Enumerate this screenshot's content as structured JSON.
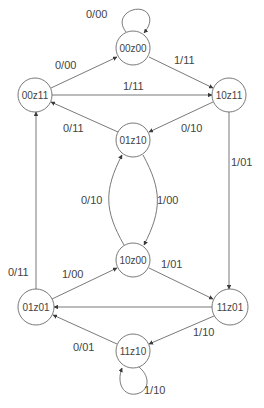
{
  "diagram": {
    "type": "state-transition-diagram",
    "states": [
      {
        "id": "s00z00",
        "label": "00z00",
        "cx": 133,
        "cy": 48,
        "r": 17
      },
      {
        "id": "s00z11",
        "label": "00z11",
        "cx": 35,
        "cy": 95,
        "r": 17
      },
      {
        "id": "s10z11",
        "label": "10z11",
        "cx": 229,
        "cy": 95,
        "r": 17
      },
      {
        "id": "s01z10",
        "label": "01z10",
        "cx": 133,
        "cy": 140,
        "r": 17
      },
      {
        "id": "s10z00",
        "label": "10z00",
        "cx": 133,
        "cy": 260,
        "r": 17
      },
      {
        "id": "s01z01",
        "label": "01z01",
        "cx": 36,
        "cy": 307,
        "r": 18
      },
      {
        "id": "s11z01",
        "label": "11z01",
        "cx": 230,
        "cy": 307,
        "r": 18
      },
      {
        "id": "s11z10",
        "label": "11z10",
        "cx": 133,
        "cy": 351,
        "r": 17
      }
    ],
    "transitions": [
      {
        "from": "00z00",
        "to": "00z00",
        "label": "0/00",
        "label_x": 86,
        "label_y": 18
      },
      {
        "from": "00z11",
        "to": "00z00",
        "label": "0/00",
        "label_x": 55,
        "label_y": 69
      },
      {
        "from": "00z00",
        "to": "10z11",
        "label": "1/11",
        "label_x": 174,
        "label_y": 64
      },
      {
        "from": "00z11",
        "to": "10z11",
        "label": "1/11",
        "label_x": 123,
        "label_y": 90
      },
      {
        "from": "01z10",
        "to": "00z11",
        "label": "0/11",
        "label_x": 63,
        "label_y": 132
      },
      {
        "from": "10z11",
        "to": "01z10",
        "label": "0/10",
        "label_x": 181,
        "label_y": 132
      },
      {
        "from": "10z11",
        "to": "11z01",
        "label": "1/01",
        "label_x": 231,
        "label_y": 166
      },
      {
        "from": "10z00",
        "to": "01z10",
        "label": "0/10",
        "label_x": 81,
        "label_y": 204
      },
      {
        "from": "01z10",
        "to": "10z00",
        "label": "1/00",
        "label_x": 157,
        "label_y": 204
      },
      {
        "from": "01z01",
        "to": "00z11",
        "label": "0/11",
        "label_x": 8,
        "label_y": 276
      },
      {
        "from": "01z01",
        "to": "10z00",
        "label": "1/00",
        "label_x": 62,
        "label_y": 278
      },
      {
        "from": "10z00",
        "to": "11z01",
        "label": "1/01",
        "label_x": 161,
        "label_y": 268
      },
      {
        "from": "11z01",
        "to": "01z01",
        "label": "",
        "label_x": 0,
        "label_y": 0
      },
      {
        "from": "11z01",
        "to": "11z10",
        "label": "1/10",
        "label_x": 193,
        "label_y": 336
      },
      {
        "from": "11z10",
        "to": "01z01",
        "label": "0/01",
        "label_x": 73,
        "label_y": 351
      },
      {
        "from": "11z10",
        "to": "11z10",
        "label": "1/10",
        "label_x": 144,
        "label_y": 394
      }
    ],
    "colors": {
      "line": "#6a6a6a",
      "text": "#444444",
      "background": "#ffffff"
    }
  }
}
